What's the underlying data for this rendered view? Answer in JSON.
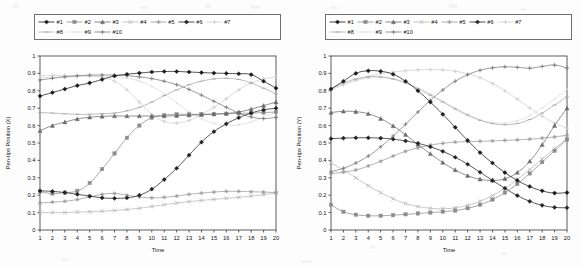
{
  "figure": {
    "panels": [
      {
        "id": "panel-x",
        "ylabel": "Pen-tips Position (X)",
        "xlabel": "Time",
        "chart_data": {
          "type": "line",
          "title": "",
          "xlabel": "Time",
          "ylabel": "Pen-tips Position (X)",
          "xlim": [
            1,
            20
          ],
          "ylim": [
            0,
            1
          ],
          "yticks": [
            0,
            0.1,
            0.2,
            0.3,
            0.4,
            0.5,
            0.6,
            0.7,
            0.8,
            0.9,
            1
          ],
          "xticks": [
            1,
            2,
            3,
            4,
            5,
            6,
            7,
            8,
            9,
            10,
            11,
            12,
            13,
            14,
            15,
            16,
            17,
            18,
            19,
            20
          ],
          "grid": false,
          "legend_position": "above",
          "x": [
            1,
            2,
            3,
            4,
            5,
            6,
            7,
            8,
            9,
            10,
            11,
            12,
            13,
            14,
            15,
            16,
            17,
            18,
            19,
            20
          ],
          "series": [
            {
              "name": "#1",
              "marker": "diamond-filled",
              "color": "#1a1a1a",
              "values": [
                0.77,
                0.79,
                0.81,
                0.83,
                0.845,
                0.865,
                0.885,
                0.895,
                0.902,
                0.908,
                0.911,
                0.911,
                0.908,
                0.905,
                0.902,
                0.9,
                0.898,
                0.893,
                0.855,
                0.815
              ]
            },
            {
              "name": "#2",
              "marker": "square",
              "color": "#8c8c8c",
              "values": [
                0.22,
                0.21,
                0.215,
                0.225,
                0.27,
                0.35,
                0.44,
                0.53,
                0.6,
                0.645,
                0.66,
                0.665,
                0.665,
                0.665,
                0.665,
                0.668,
                0.67,
                0.672,
                0.675,
                0.678
              ]
            },
            {
              "name": "#3",
              "marker": "triangle",
              "color": "#6b6b6b",
              "values": [
                0.57,
                0.6,
                0.62,
                0.638,
                0.648,
                0.653,
                0.655,
                0.655,
                0.655,
                0.655,
                0.655,
                0.657,
                0.66,
                0.663,
                0.667,
                0.67,
                0.678,
                0.695,
                0.715,
                0.735
              ]
            },
            {
              "name": "#4",
              "marker": "cross",
              "color": "#b5b5b5",
              "values": [
                0.1,
                0.1,
                0.1,
                0.103,
                0.105,
                0.108,
                0.112,
                0.118,
                0.125,
                0.135,
                0.145,
                0.155,
                0.163,
                0.17,
                0.176,
                0.182,
                0.188,
                0.195,
                0.203,
                0.212
              ]
            },
            {
              "name": "#5",
              "marker": "star",
              "color": "#9a9a9a",
              "values": [
                0.155,
                0.16,
                0.165,
                0.175,
                0.19,
                0.205,
                0.21,
                0.2,
                0.19,
                0.185,
                0.188,
                0.195,
                0.205,
                0.212,
                0.218,
                0.222,
                0.222,
                0.22,
                0.218,
                0.215
              ]
            },
            {
              "name": "#6",
              "marker": "diamond-filled2",
              "color": "#222222",
              "values": [
                0.225,
                0.222,
                0.215,
                0.205,
                0.195,
                0.185,
                0.182,
                0.185,
                0.2,
                0.235,
                0.29,
                0.355,
                0.43,
                0.505,
                0.565,
                0.61,
                0.645,
                0.672,
                0.69,
                0.7
              ]
            },
            {
              "name": "#7",
              "marker": "plus",
              "color": "#cfcfcf",
              "values": [
                0.885,
                0.888,
                0.888,
                0.887,
                0.885,
                0.878,
                0.855,
                0.805,
                0.735,
                0.665,
                0.625,
                0.615,
                0.63,
                0.665,
                0.705,
                0.755,
                0.805,
                0.845,
                0.868,
                0.88
              ]
            },
            {
              "name": "#8",
              "marker": "dash",
              "color": "#a8a8a8",
              "values": [
                0.675,
                0.672,
                0.668,
                0.665,
                0.665,
                0.668,
                0.672,
                0.685,
                0.705,
                0.735,
                0.772,
                0.805,
                0.835,
                0.855,
                0.868,
                0.872,
                0.865,
                0.845,
                0.815,
                0.782
              ]
            },
            {
              "name": "#9",
              "marker": "dot",
              "color": "#dcdcdc",
              "values": [
                0.875,
                0.878,
                0.88,
                0.882,
                0.883,
                0.883,
                0.88,
                0.872,
                0.855,
                0.825,
                0.782,
                0.73,
                0.68,
                0.64,
                0.612,
                0.6,
                0.605,
                0.622,
                0.648,
                0.678
              ]
            },
            {
              "name": "#10",
              "marker": "plus-filled",
              "color": "#7a7a7a",
              "values": [
                0.862,
                0.872,
                0.88,
                0.886,
                0.89,
                0.891,
                0.89,
                0.887,
                0.88,
                0.87,
                0.855,
                0.835,
                0.808,
                0.775,
                0.74,
                0.705,
                0.672,
                0.65,
                0.64,
                0.648
              ]
            }
          ]
        }
      },
      {
        "id": "panel-y",
        "ylabel": "Pen-tips Position (Y)",
        "xlabel": "Time",
        "chart_data": {
          "type": "line",
          "title": "",
          "xlabel": "Time",
          "ylabel": "Pen-tips Position (Y)",
          "xlim": [
            1,
            20
          ],
          "ylim": [
            0,
            1
          ],
          "yticks": [
            0,
            0.1,
            0.2,
            0.3,
            0.4,
            0.5,
            0.6,
            0.7,
            0.8,
            0.9,
            1
          ],
          "xticks": [
            1,
            2,
            3,
            4,
            5,
            6,
            7,
            8,
            9,
            10,
            11,
            12,
            13,
            14,
            15,
            16,
            17,
            18,
            19,
            20
          ],
          "grid": false,
          "legend_position": "above",
          "x": [
            1,
            2,
            3,
            4,
            5,
            6,
            7,
            8,
            9,
            10,
            11,
            12,
            13,
            14,
            15,
            16,
            17,
            18,
            19,
            20
          ],
          "series": [
            {
              "name": "#1",
              "marker": "diamond-filled",
              "color": "#1a1a1a",
              "values": [
                0.81,
                0.855,
                0.9,
                0.915,
                0.912,
                0.895,
                0.855,
                0.8,
                0.735,
                0.665,
                0.59,
                0.515,
                0.445,
                0.385,
                0.33,
                0.285,
                0.25,
                0.225,
                0.212,
                0.215
              ]
            },
            {
              "name": "#2",
              "marker": "square",
              "color": "#8c8c8c",
              "values": [
                0.145,
                0.105,
                0.088,
                0.082,
                0.082,
                0.085,
                0.09,
                0.095,
                0.1,
                0.105,
                0.112,
                0.125,
                0.145,
                0.175,
                0.215,
                0.265,
                0.325,
                0.39,
                0.455,
                0.52
              ]
            },
            {
              "name": "#3",
              "marker": "triangle",
              "color": "#6b6b6b",
              "values": [
                0.675,
                0.682,
                0.68,
                0.668,
                0.64,
                0.598,
                0.548,
                0.492,
                0.438,
                0.388,
                0.345,
                0.312,
                0.292,
                0.285,
                0.295,
                0.33,
                0.395,
                0.49,
                0.6,
                0.7
              ]
            },
            {
              "name": "#4",
              "marker": "cross",
              "color": "#b5b5b5",
              "values": [
                0.385,
                0.345,
                0.3,
                0.255,
                0.215,
                0.18,
                0.152,
                0.135,
                0.125,
                0.122,
                0.128,
                0.142,
                0.165,
                0.198,
                0.24,
                0.29,
                0.348,
                0.408,
                0.468,
                0.525
              ]
            },
            {
              "name": "#5",
              "marker": "star",
              "color": "#9a9a9a",
              "values": [
                0.325,
                0.332,
                0.345,
                0.368,
                0.395,
                0.425,
                0.452,
                0.472,
                0.488,
                0.498,
                0.505,
                0.508,
                0.51,
                0.512,
                0.515,
                0.518,
                0.522,
                0.528,
                0.535,
                0.545
              ]
            },
            {
              "name": "#6",
              "marker": "diamond-filled2",
              "color": "#222222",
              "values": [
                0.525,
                0.528,
                0.53,
                0.53,
                0.528,
                0.522,
                0.512,
                0.498,
                0.478,
                0.452,
                0.418,
                0.378,
                0.332,
                0.285,
                0.24,
                0.198,
                0.165,
                0.142,
                0.13,
                0.128
              ]
            },
            {
              "name": "#7",
              "marker": "plus",
              "color": "#cfcfcf",
              "values": [
                0.805,
                0.835,
                0.862,
                0.882,
                0.898,
                0.908,
                0.915,
                0.92,
                0.922,
                0.92,
                0.912,
                0.898,
                0.875,
                0.842,
                0.8,
                0.752,
                0.702,
                0.655,
                0.615,
                0.585
              ]
            },
            {
              "name": "#8",
              "marker": "dash",
              "color": "#a8a8a8",
              "values": [
                0.812,
                0.845,
                0.868,
                0.88,
                0.88,
                0.868,
                0.845,
                0.812,
                0.775,
                0.735,
                0.695,
                0.66,
                0.63,
                0.612,
                0.605,
                0.612,
                0.635,
                0.672,
                0.718,
                0.765
              ]
            },
            {
              "name": "#9",
              "marker": "dot",
              "color": "#dcdcdc",
              "values": [
                0.808,
                0.835,
                0.858,
                0.872,
                0.875,
                0.868,
                0.848,
                0.818,
                0.782,
                0.742,
                0.702,
                0.665,
                0.635,
                0.618,
                0.615,
                0.628,
                0.658,
                0.702,
                0.755,
                0.808
              ]
            },
            {
              "name": "#10",
              "marker": "plus-filled",
              "color": "#7a7a7a",
              "values": [
                0.335,
                0.355,
                0.385,
                0.425,
                0.478,
                0.54,
                0.608,
                0.678,
                0.745,
                0.805,
                0.855,
                0.892,
                0.918,
                0.932,
                0.938,
                0.935,
                0.93,
                0.94,
                0.948,
                0.93
              ]
            }
          ]
        }
      }
    ],
    "legend": {
      "row1": [
        {
          "label": "#1",
          "marker": "diamond-filled",
          "color": "#1a1a1a"
        },
        {
          "label": "#2",
          "marker": "square",
          "color": "#8c8c8c"
        },
        {
          "label": "#3",
          "marker": "triangle",
          "color": "#6b6b6b"
        },
        {
          "label": "#4",
          "marker": "cross",
          "color": "#b5b5b5"
        },
        {
          "label": "#5",
          "marker": "star",
          "color": "#9a9a9a"
        },
        {
          "label": "#6",
          "marker": "diamond-filled2",
          "color": "#222222"
        },
        {
          "label": "#7",
          "marker": "plus",
          "color": "#cfcfcf"
        }
      ],
      "row2": [
        {
          "label": "#8",
          "marker": "dash",
          "color": "#a8a8a8"
        },
        {
          "label": "#9",
          "marker": "dot",
          "color": "#dcdcdc"
        },
        {
          "label": "#10",
          "marker": "plus-filled",
          "color": "#7a7a7a"
        }
      ]
    }
  }
}
